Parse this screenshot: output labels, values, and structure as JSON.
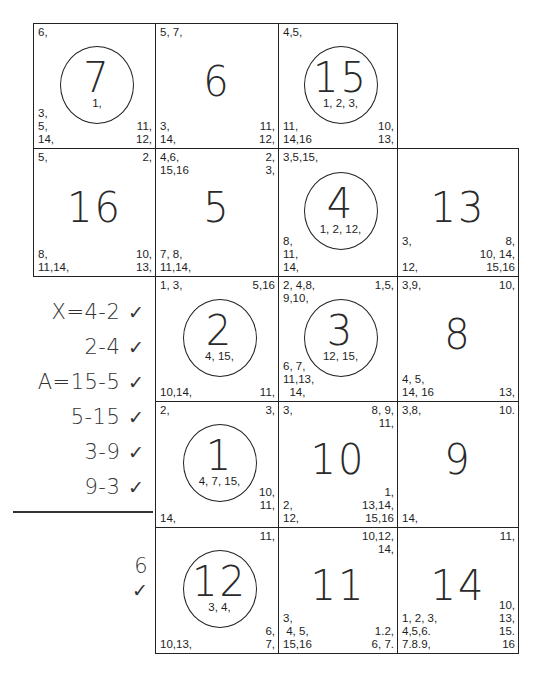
{
  "grid": {
    "cells": [
      {
        "id": "cell-7",
        "number": "7",
        "circled": true,
        "x": 33,
        "y": 23,
        "w": 122,
        "h": 125,
        "tl": "6,",
        "tr": "",
        "bl": "3,\n5,\n14,",
        "br": "11,\n12,",
        "inner": "1,"
      },
      {
        "id": "cell-6",
        "number": "6",
        "circled": false,
        "x": 155,
        "y": 23,
        "w": 123,
        "h": 125,
        "tl": "5, 7,",
        "tr": "",
        "bl": "3,\n14,",
        "br": "11,\n12,",
        "inner": ""
      },
      {
        "id": "cell-15",
        "number": "15",
        "circled": true,
        "x": 278,
        "y": 23,
        "w": 119,
        "h": 125,
        "tl": "4,5,",
        "tr": "",
        "bl": "11,\n14,16",
        "br": "10,\n13,",
        "inner": "1, 2, 3,"
      },
      {
        "id": "cell-16",
        "number": "16",
        "circled": false,
        "x": 33,
        "y": 148,
        "w": 122,
        "h": 128,
        "tl": "5,",
        "tr": "2,",
        "bl": "8,\n11,14,",
        "br": "10,\n13,",
        "inner": ""
      },
      {
        "id": "cell-5",
        "number": "5",
        "circled": false,
        "x": 155,
        "y": 148,
        "w": 123,
        "h": 128,
        "tl": "4,6,\n15,16",
        "tr": "2,\n3,",
        "bl": "7, 8,\n11,14,",
        "br": "",
        "inner": ""
      },
      {
        "id": "cell-4",
        "number": "4",
        "circled": true,
        "x": 278,
        "y": 148,
        "w": 119,
        "h": 128,
        "tl": "3,5,15,",
        "tr": "",
        "bl": "8,\n11,\n14,",
        "br": "",
        "inner": "1, 2, 12,"
      },
      {
        "id": "cell-13",
        "number": "13",
        "circled": false,
        "x": 397,
        "y": 148,
        "w": 121,
        "h": 128,
        "tl": "",
        "tr": "",
        "bl": "3,\n\n12,",
        "br": "8,\n10, 14,\n15,16",
        "inner": ""
      },
      {
        "id": "cell-2",
        "number": "2",
        "circled": true,
        "x": 155,
        "y": 276,
        "w": 123,
        "h": 125,
        "tl": "1, 3,",
        "tr": "5,16",
        "bl": "10,14,",
        "br": "11,",
        "inner": "4, 15,"
      },
      {
        "id": "cell-3",
        "number": "3",
        "circled": true,
        "x": 278,
        "y": 276,
        "w": 119,
        "h": 125,
        "tl": "2, 4,8,\n9,10,",
        "tr": "1,5,",
        "bl": "6, 7,\n11,13,\n  14,",
        "br": "",
        "inner": "12, 15,"
      },
      {
        "id": "cell-8",
        "number": "8",
        "circled": false,
        "x": 397,
        "y": 276,
        "w": 121,
        "h": 125,
        "tl": "3,9,",
        "tr": "10,",
        "bl": "4, 5,\n14, 16",
        "br": "13,",
        "inner": ""
      },
      {
        "id": "cell-1",
        "number": "1",
        "circled": true,
        "x": 155,
        "y": 401,
        "w": 123,
        "h": 126,
        "tl": "2,",
        "tr": "3,",
        "bl": "14,",
        "br": "10,\n11,\n ",
        "inner": "4, 7, 15,"
      },
      {
        "id": "cell-10",
        "number": "10",
        "circled": false,
        "x": 278,
        "y": 401,
        "w": 119,
        "h": 126,
        "tl": "3,",
        "tr": "8, 9,\n11,",
        "bl": "2,\n12,",
        "br": "1,\n13,14,\n15,16",
        "inner": ""
      },
      {
        "id": "cell-9",
        "number": "9",
        "circled": false,
        "x": 397,
        "y": 401,
        "w": 121,
        "h": 126,
        "tl": "3,8,",
        "tr": "10.",
        "bl": "14,",
        "br": "",
        "inner": ""
      },
      {
        "id": "cell-12",
        "number": "12",
        "circled": true,
        "x": 155,
        "y": 527,
        "w": 123,
        "h": 126,
        "tl": "",
        "tr": "11,",
        "bl": "10,13,",
        "br": "6,\n7,",
        "inner": "3, 4,"
      },
      {
        "id": "cell-11",
        "number": "11",
        "circled": false,
        "x": 278,
        "y": 527,
        "w": 119,
        "h": 126,
        "tl": "",
        "tr": "10,12,\n14,",
        "bl": "3,\n 4, 5,\n15,16",
        "br": "1.2,\n6, 7.",
        "inner": ""
      },
      {
        "id": "cell-14",
        "number": "14",
        "circled": false,
        "x": 397,
        "y": 527,
        "w": 121,
        "h": 126,
        "tl": "",
        "tr": "11,",
        "bl": "1, 2, 3,\n4,5,6.\n7.8.9,",
        "br": "10,\n13,\n15.\n16",
        "inner": ""
      }
    ]
  },
  "notes": {
    "lines": [
      {
        "text": "X=4-2",
        "check": "✓",
        "y": 314
      },
      {
        "text": "2-4",
        "check": "✓",
        "y": 349
      },
      {
        "text": "A=15-5",
        "check": "✓",
        "y": 384
      },
      {
        "text": "5-15",
        "check": "✓",
        "y": 419
      },
      {
        "text": "3-9",
        "check": "✓",
        "y": 454
      },
      {
        "text": "9-3",
        "check": "✓",
        "y": 489
      }
    ],
    "total": {
      "text": "6",
      "check": "✓"
    }
  }
}
